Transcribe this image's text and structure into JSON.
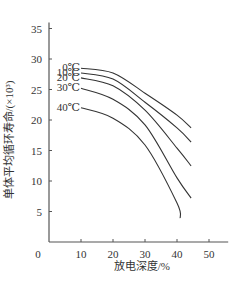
{
  "chart_data": {
    "type": "line",
    "title": "",
    "xlabel": "放电深度/%",
    "ylabel": "单体平均循环寿命/(×10³)",
    "xlim": [
      0,
      56
    ],
    "ylim": [
      0,
      36
    ],
    "x_ticks": [
      10,
      20,
      30,
      40,
      50
    ],
    "y_ticks": [
      5,
      10,
      15,
      20,
      25,
      30,
      35
    ],
    "origin_label": "0",
    "grid": false,
    "legend": "inline-left",
    "series": [
      {
        "name": "0℃",
        "x": [
          10,
          20,
          30,
          40,
          44.4
        ],
        "y": [
          28.5,
          27.7,
          24.4,
          20.8,
          18.7
        ]
      },
      {
        "name": "10℃",
        "x": [
          10,
          20,
          30,
          40,
          44.4
        ],
        "y": [
          27.7,
          26.7,
          22.9,
          18.7,
          16.4
        ]
      },
      {
        "name": "20℃",
        "x": [
          10,
          20,
          30,
          40,
          44.4
        ],
        "y": [
          26.9,
          25.6,
          21.6,
          15.4,
          12.5
        ]
      },
      {
        "name": "30℃",
        "x": [
          10,
          20,
          30,
          40,
          44.4
        ],
        "y": [
          25.2,
          23.4,
          19.2,
          10.5,
          7.2
        ]
      },
      {
        "name": "40℃",
        "x": [
          10,
          20,
          30,
          40,
          41
        ],
        "y": [
          22.0,
          20.3,
          15.9,
          6.4,
          3.9
        ]
      }
    ]
  }
}
